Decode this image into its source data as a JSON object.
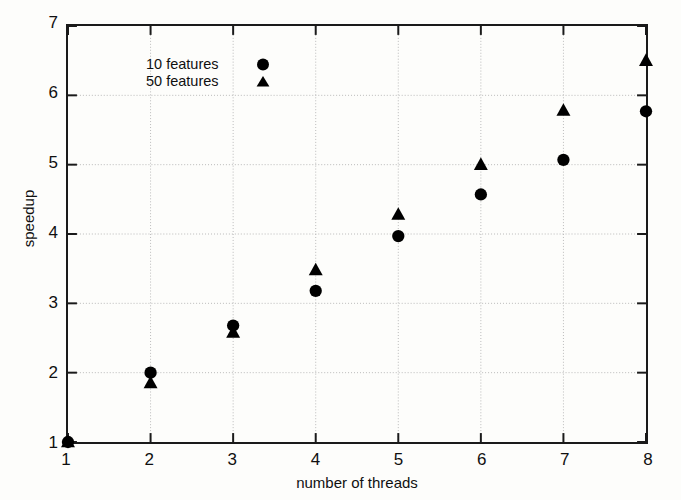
{
  "chart_data": {
    "type": "scatter",
    "title": "",
    "xlabel": "number of threads",
    "ylabel": "speedup",
    "xlim": [
      1,
      8
    ],
    "ylim": [
      1,
      7
    ],
    "xticks": [
      1,
      2,
      3,
      4,
      5,
      6,
      7,
      8
    ],
    "yticks": [
      1,
      2,
      3,
      4,
      5,
      6,
      7
    ],
    "grid": true,
    "legend_position": "top-left",
    "x": [
      1,
      2,
      3,
      4,
      5,
      6,
      7,
      8
    ],
    "series": [
      {
        "name": "10 features",
        "marker": "circle",
        "color": "#000000",
        "values": [
          1.0,
          2.0,
          2.68,
          3.18,
          3.97,
          4.57,
          5.07,
          5.77
        ]
      },
      {
        "name": "50 features",
        "marker": "triangle",
        "color": "#000000",
        "values": [
          1.0,
          1.85,
          2.58,
          3.48,
          4.28,
          5.0,
          5.78,
          6.5
        ]
      }
    ]
  },
  "style": {
    "axis_color": "#1a1a1a",
    "grid_color": "#b9b9b9",
    "background": "#fdfdfb",
    "text_color": "#101010"
  }
}
